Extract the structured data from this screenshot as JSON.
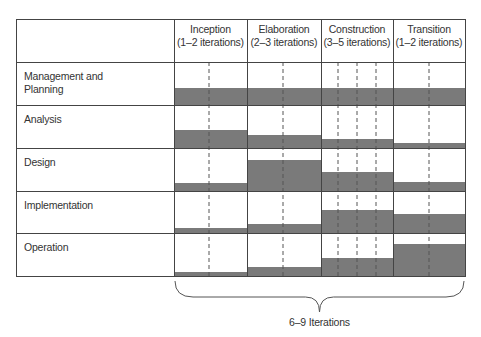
{
  "phases": [
    {
      "name": "Inception",
      "iterations": "(1–2 iterations)",
      "x0": 174,
      "x1": 247,
      "dividers": [
        209
      ]
    },
    {
      "name": "Elaboration",
      "iterations": "(2–3 iterations)",
      "x0": 247,
      "x1": 321,
      "dividers": [
        283
      ]
    },
    {
      "name": "Construction",
      "iterations": "(3–5 iterations)",
      "x0": 321,
      "x1": 393,
      "dividers": [
        338,
        357,
        376
      ]
    },
    {
      "name": "Transition",
      "iterations": "(1–2 iterations)",
      "x0": 393,
      "x1": 465,
      "dividers": [
        429
      ]
    }
  ],
  "disciplines": [
    {
      "label_lines": [
        "Management and",
        "Planning"
      ],
      "y0": 62,
      "y1": 105,
      "bar_heights": [
        17,
        17,
        17,
        17
      ]
    },
    {
      "label_lines": [
        "Analysis"
      ],
      "y0": 105,
      "y1": 148,
      "bar_heights": [
        18,
        13,
        9,
        5
      ]
    },
    {
      "label_lines": [
        "Design"
      ],
      "y0": 148,
      "y1": 191,
      "bar_heights": [
        8,
        31,
        19,
        9
      ]
    },
    {
      "label_lines": [
        "Implementation"
      ],
      "y0": 191,
      "y1": 233,
      "bar_heights": [
        5,
        9,
        23,
        19
      ]
    },
    {
      "label_lines": [
        "Operation"
      ],
      "y0": 233,
      "y1": 276,
      "bar_heights": [
        4,
        9,
        18,
        32
      ]
    }
  ],
  "footer": {
    "label": "6–9 Iterations"
  },
  "colors": {
    "bar": "#7a7a7a",
    "line": "#444444",
    "dash": "#555555"
  },
  "layout": {
    "left": 16,
    "top": 19,
    "header_bottom": 62,
    "right": 465,
    "bottom": 276
  }
}
